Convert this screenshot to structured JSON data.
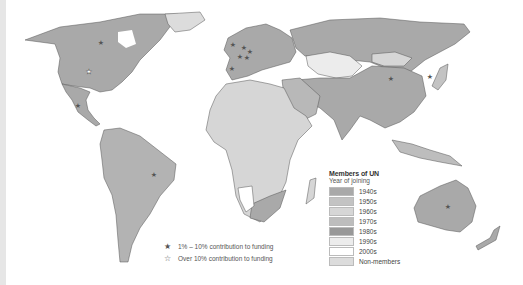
{
  "legend": {
    "title": "Members of UN",
    "subtitle": "Year of joining",
    "items": [
      {
        "label": "1940s",
        "color": "#a9a9a9"
      },
      {
        "label": "1950s",
        "color": "#c3c3c3"
      },
      {
        "label": "1960s",
        "color": "#d6d6d6"
      },
      {
        "label": "1970s",
        "color": "#bdbdbd"
      },
      {
        "label": "1980s",
        "color": "#989898"
      },
      {
        "label": "1990s",
        "color": "#ececec"
      },
      {
        "label": "2000s",
        "color": "#ffffff"
      },
      {
        "label": "Non-members",
        "color": "#dcdcdc"
      }
    ]
  },
  "funding_legend": {
    "items": [
      {
        "icon": "filled-star-icon",
        "glyph": "★",
        "label": "1% – 10% contribution to funding"
      },
      {
        "icon": "outline-star-icon",
        "glyph": "☆",
        "label": "Over 10% contribution to funding"
      }
    ]
  },
  "colors": {
    "land_1940s": "#a9a9a9",
    "land_1950s": "#c3c3c3",
    "land_1960s": "#d6d6d6",
    "border": "#444444",
    "star": "#555555"
  }
}
